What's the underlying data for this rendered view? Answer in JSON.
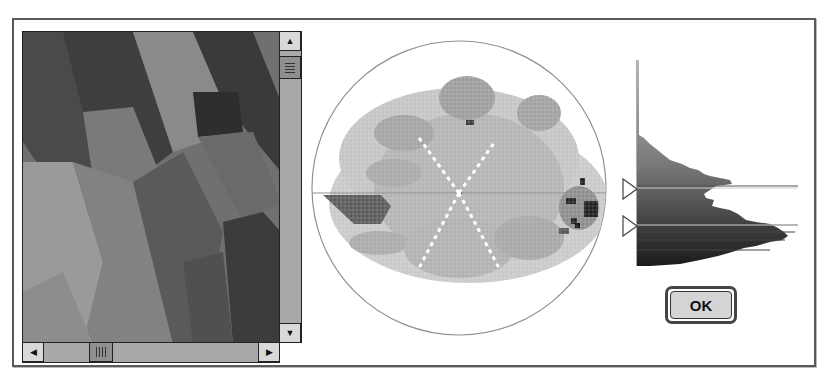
{
  "dialog": {
    "ok_label": "OK"
  },
  "image_preview": {
    "description": "grayscale photo preview",
    "vertical_scrollbar": {
      "up_arrow": "▲",
      "down_arrow": "▼",
      "thumb_position_pct": 10
    },
    "horizontal_scrollbar": {
      "left_arrow": "◀",
      "right_arrow": "▶",
      "thumb_position_pct": 25
    }
  },
  "polar_plot": {
    "description": "circular hue/saturation density plot",
    "colors": {
      "outline": "#8a8a8a",
      "dense": "#3a3a3a",
      "medium": "#8c8c8c",
      "light": "#c8c8c8"
    }
  },
  "histogram": {
    "description": "vertical luminance histogram with two range markers",
    "markers": [
      {
        "id": "upper",
        "y_pct": 60
      },
      {
        "id": "lower",
        "y_pct": 81
      }
    ],
    "marker_icon": "triangle-right-outline"
  },
  "icons": {
    "scroll_up": "up-arrow",
    "scroll_down": "down-arrow",
    "scroll_left": "left-arrow",
    "scroll_right": "right-arrow",
    "thumb_grip": "grip-lines"
  }
}
